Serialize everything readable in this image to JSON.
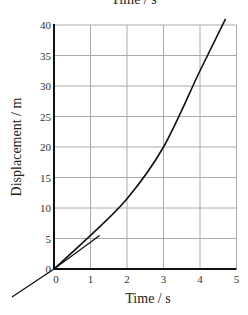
{
  "chart_data": {
    "type": "line",
    "title": "",
    "top_cutoff_text": "Time / s",
    "xlabel": "Time / s",
    "ylabel": "Displacement / m",
    "xlim": [
      0,
      5
    ],
    "ylim": [
      0,
      40
    ],
    "x_ticks": [
      "0",
      "1",
      "2",
      "3",
      "4",
      "5"
    ],
    "y_ticks": [
      "0",
      "5",
      "10",
      "15",
      "20",
      "25",
      "30",
      "35",
      "40"
    ],
    "grid": true,
    "series": [
      {
        "name": "displacement curve",
        "x": [
          0,
          1,
          2,
          3,
          4,
          4.7
        ],
        "y": [
          0,
          5.5,
          11.5,
          20,
          32.5,
          41
        ]
      },
      {
        "name": "tangent at origin",
        "x": [
          -1.15,
          0,
          1.25
        ],
        "y": [
          -4.6,
          0,
          5.5
        ]
      }
    ],
    "colors": {
      "line": "#111111",
      "grid": "#aaaaaa",
      "axis": "#111111"
    }
  }
}
